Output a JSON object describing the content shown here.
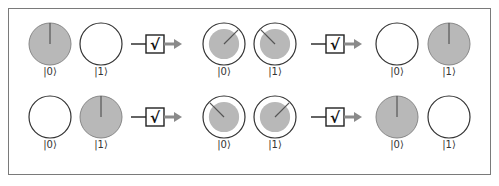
{
  "colors": {
    "filled": "#b8b8b8",
    "stroke": "#333333",
    "needle": "#555555",
    "arrow": "#8a8a8a",
    "frame": "#7a7a7a"
  },
  "gate": {
    "name": "square-root-of-not",
    "symbol": "√"
  },
  "rows": [
    {
      "input": [
        {
          "label": "|0⟩",
          "state": "full",
          "angle_deg": 0
        },
        {
          "label": "|1⟩",
          "state": "empty"
        }
      ],
      "middle": [
        {
          "label": "|0⟩",
          "state": "half",
          "angle_deg": 45
        },
        {
          "label": "|1⟩",
          "state": "half",
          "angle_deg": -45
        }
      ],
      "output": [
        {
          "label": "|0⟩",
          "state": "empty"
        },
        {
          "label": "|1⟩",
          "state": "full",
          "angle_deg": 0
        }
      ]
    },
    {
      "input": [
        {
          "label": "|0⟩",
          "state": "empty"
        },
        {
          "label": "|1⟩",
          "state": "full",
          "angle_deg": 0
        }
      ],
      "middle": [
        {
          "label": "|0⟩",
          "state": "half",
          "angle_deg": -45
        },
        {
          "label": "|1⟩",
          "state": "half",
          "angle_deg": 45
        }
      ],
      "output": [
        {
          "label": "|0⟩",
          "state": "full",
          "angle_deg": 0
        },
        {
          "label": "|1⟩",
          "state": "empty"
        }
      ]
    }
  ]
}
